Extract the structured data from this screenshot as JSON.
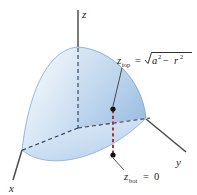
{
  "figure": {
    "name": "hemisphere-z-limits-diagram",
    "background_color": "#ffffff"
  },
  "axes": {
    "x_label": "x",
    "y_label": "y",
    "z_label": "z",
    "axis_color": "#4a4a4a"
  },
  "labels": {
    "z_top": {
      "var": "z",
      "sub": "top",
      "equals": "=",
      "radicand_a": "a",
      "exp_a": "2",
      "minus": "−",
      "radicand_r": "r",
      "exp_r": "2",
      "full_text": "z_top = √(a² − r²)"
    },
    "z_bot": {
      "var": "z",
      "sub": "bot",
      "equals": "=",
      "value": "0",
      "full_text": "z_bot = 0"
    }
  },
  "surface": {
    "name": "hemisphere-octant-surface",
    "fill_light": "#eef4fb",
    "fill_mid": "#c3d9ef",
    "fill_deep": "#8fb8dd",
    "edge_color": "#6f9ccb"
  },
  "segment": {
    "name": "vertical-z-segment",
    "color": "#a03a3a",
    "style": "dashed",
    "endpoint_color": "#101010"
  },
  "guides": {
    "dash_color": "#2b3c55",
    "leader_color": "#3a3a3a"
  }
}
